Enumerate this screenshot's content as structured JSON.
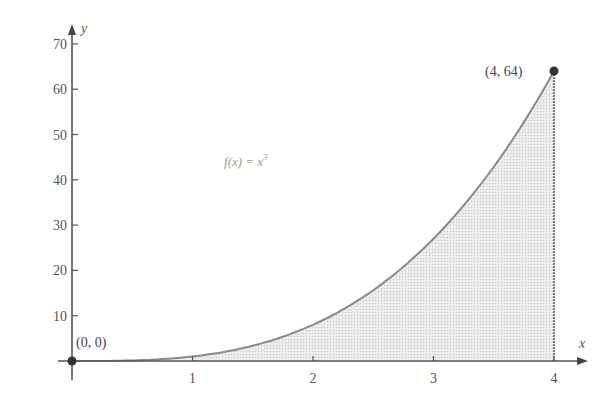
{
  "chart_data": {
    "type": "area",
    "title": "",
    "function": "f(x) = x^3",
    "xlabel": "x",
    "ylabel": "y",
    "xlim": [
      0,
      4.2
    ],
    "ylim": [
      0,
      72
    ],
    "x_ticks": [
      1,
      2,
      3,
      4
    ],
    "y_ticks": [
      10,
      20,
      30,
      40,
      50,
      60,
      70
    ],
    "x": [
      0,
      0.5,
      1,
      1.5,
      2,
      2.5,
      3,
      3.5,
      4
    ],
    "series": [
      {
        "name": "f(x) = x^3",
        "values": [
          0,
          0.125,
          1,
          3.375,
          8,
          15.625,
          27,
          42.875,
          64
        ]
      }
    ],
    "shaded_region": {
      "from_x": 0,
      "to_x": 4,
      "under": "f(x) = x^3",
      "color": "#e6e6e6"
    },
    "annotations": [
      {
        "text": "(0, 0)",
        "x": 0,
        "y": 0
      },
      {
        "text": "(4, 64)",
        "x": 4,
        "y": 64
      },
      {
        "text": "f(x) = x³",
        "x": 1.4,
        "y": 43
      }
    ],
    "grid": false,
    "legend": "none"
  },
  "labels": {
    "x_axis": "x",
    "y_axis": "y",
    "origin_point": "(0, 0)",
    "end_point": "(4, 64)",
    "function_left": "f",
    "function_mid": "(x) = x",
    "function_exp": "3",
    "x_ticks": [
      "1",
      "2",
      "3",
      "4"
    ],
    "y_ticks": [
      "10",
      "20",
      "30",
      "40",
      "50",
      "60",
      "70"
    ]
  },
  "colors": {
    "axis": "#555555",
    "curve": "#888888",
    "fill": "#e6e6e6",
    "point": "#333333"
  }
}
